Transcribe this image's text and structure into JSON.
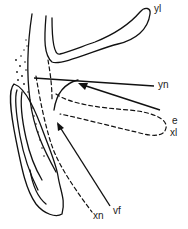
{
  "labels": {
    "yl": "yl",
    "yn": "yn",
    "e": "e",
    "xl": "xl",
    "xn": "xn",
    "vf": "vf"
  },
  "colors": {
    "stroke": "#111111",
    "background": "#ffffff"
  }
}
